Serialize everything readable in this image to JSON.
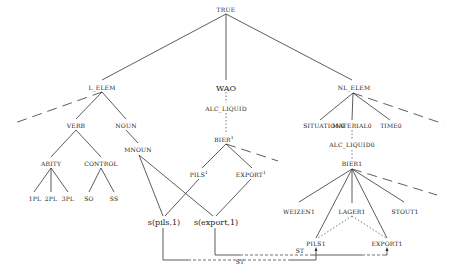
{
  "diagram": {
    "root": "TRUE",
    "level1": {
      "l_elem": "L_ELEM",
      "wao": "WAO",
      "nl_elem": "NL_ELEM"
    },
    "left": {
      "verb": "VERB",
      "noun": "NOUN",
      "arity": "ARITY",
      "control": "CONTROL",
      "mnoun": "MNOUN",
      "arity_children": [
        "1PL",
        "2PL",
        "3PL"
      ],
      "control_children": [
        "SO",
        "SS"
      ]
    },
    "middle": {
      "alc_liquid": "ALC_LIQUID",
      "bier": "BIER",
      "bier_sup": "1",
      "pils": "PILS",
      "pils_sup": "1",
      "export": "EXPORT",
      "export_sup": "1",
      "s_pils": "s(pils,1)",
      "s_export": "s(export,1)"
    },
    "right": {
      "situation": "SITUATION0",
      "material": "MATERIAL0",
      "time": "TIME0",
      "alc_liquid0": "ALC_LIQUID0",
      "bier1": "BIER1",
      "weizen": "WEIZEN1",
      "lager": "LAGER1",
      "stout": "STOUT1",
      "pils1": "PILS1",
      "export1": "EXPORT1"
    },
    "relations": {
      "st_upper": "ST",
      "st_lower": "ST"
    }
  }
}
